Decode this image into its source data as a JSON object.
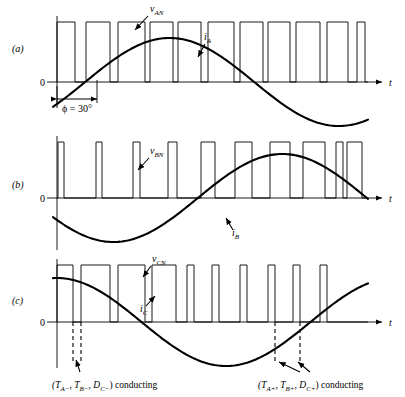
{
  "figure": {
    "type": "waveform-diagram",
    "axis_label_t": "t",
    "zero_label": "0"
  },
  "panels": [
    {
      "id": "a",
      "label": "(a)",
      "voltage_label": "v",
      "voltage_sub": "AN",
      "current_label": "i",
      "current_sub": "A",
      "phase_annotation": {
        "text": "ϕ = 30°",
        "from_x": 57,
        "to_x": 97
      },
      "axis": {
        "x0": 57,
        "x1": 382,
        "y_zero": 82,
        "v_top": 22
      },
      "current_curve": "sine",
      "current_phase_deg": -30,
      "current_amp": 44,
      "current_y_center": 82,
      "pulses": [
        [
          57,
          75
        ],
        [
          86,
          110
        ],
        [
          118,
          145
        ],
        [
          150,
          173
        ],
        [
          178,
          201
        ],
        [
          208,
          234
        ],
        [
          240,
          263
        ],
        [
          268,
          290
        ],
        [
          296,
          320
        ],
        [
          327,
          348
        ],
        [
          357,
          365
        ]
      ]
    },
    {
      "id": "b",
      "label": "(b)",
      "voltage_label": "v",
      "voltage_sub": "BN",
      "current_label": "i",
      "current_sub": "B",
      "axis": {
        "x0": 57,
        "x1": 382,
        "y_zero": 198,
        "v_top": 142
      },
      "current_curve": "sine",
      "current_phase_deg": -150,
      "current_amp": 44,
      "current_y_center": 198,
      "pulses": [
        [
          58,
          64
        ],
        [
          96,
          102
        ],
        [
          133,
          140
        ],
        [
          168,
          177
        ],
        [
          201,
          215
        ],
        [
          235,
          252
        ],
        [
          270,
          290
        ],
        [
          303,
          325
        ],
        [
          336,
          343
        ],
        [
          347,
          362
        ]
      ]
    },
    {
      "id": "c",
      "label": "(c)",
      "voltage_label": "v",
      "voltage_sub": "CN",
      "current_label": "i",
      "current_sub": "C",
      "axis": {
        "x0": 57,
        "x1": 382,
        "y_zero": 322,
        "v_top": 265
      },
      "current_curve": "sine",
      "current_phase_deg": 90,
      "current_amp": 44,
      "current_y_center": 322,
      "pulses": [
        [
          57,
          73
        ],
        [
          81,
          110
        ],
        [
          118,
          145
        ],
        [
          152,
          176
        ],
        [
          187,
          194
        ],
        [
          212,
          219
        ],
        [
          240,
          247
        ],
        [
          268,
          275
        ],
        [
          293,
          300
        ],
        [
          320,
          327
        ]
      ],
      "dashed_left": [
        73,
        81
      ],
      "dashed_right": [
        275,
        300
      ],
      "annotation_left": {
        "prefix": "(T",
        "sub1": "A−",
        "mid1": ", T",
        "sub2": "B−",
        "mid2": ", D",
        "sub3": "C−",
        "suffix": ") conducting"
      },
      "annotation_right": {
        "prefix": "(T",
        "sub1": "A+",
        "mid1": ", T",
        "sub2": "B+",
        "mid2": ", D",
        "sub3": "C+",
        "suffix": ") conducting"
      }
    }
  ],
  "chart_data": {
    "type": "line",
    "title": "",
    "xlabel": "t",
    "ylabel": "",
    "series": [
      {
        "name": "v_AN",
        "type": "pwm-pulse-train",
        "panel": "a"
      },
      {
        "name": "i_A",
        "type": "sinusoid",
        "panel": "a",
        "phase_deg": -30
      },
      {
        "name": "v_BN",
        "type": "pwm-pulse-train",
        "panel": "b"
      },
      {
        "name": "i_B",
        "type": "sinusoid",
        "panel": "b",
        "phase_deg": -150
      },
      {
        "name": "v_CN",
        "type": "pwm-pulse-train",
        "panel": "c"
      },
      {
        "name": "i_C",
        "type": "sinusoid",
        "panel": "c",
        "phase_deg": 90
      }
    ],
    "annotations": [
      "ϕ = 30°",
      "(T_A-, T_B-, D_C-) conducting",
      "(T_A+, T_B+, D_C+) conducting"
    ],
    "grid": false,
    "legend": "none"
  }
}
